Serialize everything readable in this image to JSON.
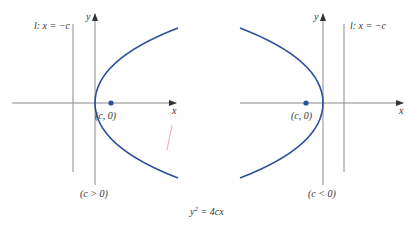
{
  "figure": {
    "caption": "y² = 4cx",
    "caption_parts": {
      "base": "y",
      "exp": "2",
      "rest": " = 4cx"
    },
    "colors": {
      "curve": "#2b4f9a",
      "axis": "#8a8a8a",
      "focus": "#2b4f9a",
      "text": "#333333"
    }
  },
  "left_panel": {
    "condition_label": "(c > 0)",
    "directrix_label": "l: x = −c",
    "focus_label": "(c, 0)",
    "x_axis_label": "x",
    "y_axis_label": "y",
    "opens": "right"
  },
  "right_panel": {
    "condition_label": "(c < 0)",
    "directrix_label": "l: x = −c",
    "focus_label": "(c, 0)",
    "x_axis_label": "x",
    "y_axis_label": "y",
    "opens": "left"
  }
}
